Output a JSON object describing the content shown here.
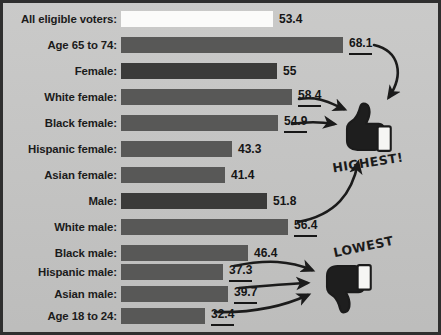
{
  "chart_data": {
    "type": "bar",
    "title": "",
    "xlabel": "",
    "ylabel": "",
    "orientation": "horizontal",
    "grid": false,
    "xlim": [
      0,
      70
    ],
    "categories": [
      "All eligible voters:",
      "Age 65 to 74:",
      "Female:",
      "White female:",
      "Black female:",
      "Hispanic female:",
      "Asian female:",
      "Male:",
      "White male:",
      "Black male:",
      "Hispanic male:",
      "Asian male:",
      "Age 18 to 24:"
    ],
    "values": [
      53.4,
      68.1,
      55,
      58.4,
      54.9,
      43.3,
      41.4,
      51.8,
      56.4,
      46.4,
      37.3,
      39.7,
      32.4
    ],
    "value_labels": [
      "53.4",
      "68.1",
      "55",
      "58.4",
      "54.9",
      "43.3",
      "41.4",
      "51.8",
      "56.4",
      "46.4",
      "37.3",
      "39.7",
      "32.4"
    ],
    "annotations": [
      "HIGHEST!",
      "LOWEST"
    ]
  },
  "colors": {
    "background": "#c7c7c6",
    "frame": "#2f2f2f",
    "bar_default": "#585857",
    "bar_dark": "#3b3b3a",
    "bar_white": "#fbfbfa",
    "text": "#1b1b1b"
  },
  "rows": [
    {
      "label": "All eligible voters:",
      "value": "53.4",
      "num": 53.4,
      "style": "white",
      "underline": false,
      "top": 6,
      "width": 152
    },
    {
      "label": "Age 65 to 74:",
      "value": "68.1",
      "num": 68.1,
      "style": "default",
      "underline": true,
      "top": 32,
      "width": 222
    },
    {
      "label": "Female:",
      "value": "55",
      "num": 55.0,
      "style": "dark",
      "underline": false,
      "top": 58,
      "width": 156
    },
    {
      "label": "White female:",
      "value": "58.4",
      "num": 58.4,
      "style": "default",
      "underline": true,
      "top": 84,
      "width": 171
    },
    {
      "label": "Black female:",
      "value": "54.9",
      "num": 54.9,
      "style": "default",
      "underline": true,
      "top": 110,
      "width": 157
    },
    {
      "label": "Hispanic female:",
      "value": "43.3",
      "num": 43.3,
      "style": "default",
      "underline": false,
      "top": 136,
      "width": 111
    },
    {
      "label": "Asian female:",
      "value": "41.4",
      "num": 41.4,
      "style": "default",
      "underline": false,
      "top": 162,
      "width": 104
    },
    {
      "label": "Male:",
      "value": "51.8",
      "num": 51.8,
      "style": "dark",
      "underline": false,
      "top": 188,
      "width": 146
    },
    {
      "label": "White male:",
      "value": "56.4",
      "num": 56.4,
      "style": "default",
      "underline": true,
      "top": 214,
      "width": 167
    },
    {
      "label": "Black male:",
      "value": "46.4",
      "num": 46.4,
      "style": "default",
      "underline": false,
      "top": 240,
      "width": 127
    },
    {
      "label": "Hispanic male:",
      "value": "37.3",
      "num": 37.3,
      "style": "default",
      "underline": true,
      "top": 259,
      "width": 102
    },
    {
      "label": "Asian male:",
      "value": "39.7",
      "num": 39.7,
      "style": "default",
      "underline": true,
      "top": 281,
      "width": 107
    },
    {
      "label": "Age 18 to 24:",
      "value": "32.4",
      "num": 32.4,
      "style": "default",
      "underline": true,
      "top": 303,
      "width": 84
    }
  ],
  "callouts": {
    "highest": "HIGHEST!",
    "lowest": "LOWEST"
  },
  "icons": {
    "thumbs_up": "thumbs-up-icon",
    "thumbs_down": "thumbs-down-icon"
  }
}
